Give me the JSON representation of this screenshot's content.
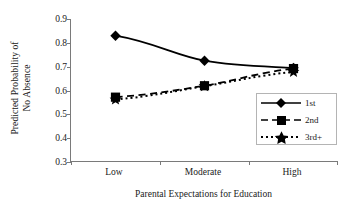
{
  "chart_data": {
    "type": "line",
    "title": "",
    "xlabel": "Parental Expectations for Education",
    "ylabel_line1": "Predicted Probability of",
    "ylabel_line2": "No Absence",
    "categories": [
      "Low",
      "Moderate",
      "High"
    ],
    "ylim": [
      0.3,
      0.9
    ],
    "yticks": [
      0.3,
      0.4,
      0.5,
      0.6,
      0.7,
      0.8,
      0.9
    ],
    "ytick_labels": [
      "0.3",
      "0.4",
      "0.5",
      "0.6",
      "0.7",
      "0.8",
      "0.9"
    ],
    "grid": false,
    "legend_position": "lower-right-inside",
    "series": [
      {
        "name": "1st",
        "values": [
          0.83,
          0.725,
          0.695
        ],
        "marker": "diamond",
        "linestyle": "solid",
        "color": "#000000"
      },
      {
        "name": "2nd",
        "values": [
          0.572,
          0.62,
          0.692
        ],
        "marker": "square",
        "linestyle": "dashed",
        "color": "#000000"
      },
      {
        "name": "3rd+",
        "values": [
          0.562,
          0.618,
          0.678
        ],
        "marker": "star",
        "linestyle": "dotted",
        "color": "#000000"
      }
    ]
  },
  "legend": {
    "entries": [
      {
        "label": "1st"
      },
      {
        "label": "2nd"
      },
      {
        "label": "3rd+"
      }
    ]
  },
  "axes": {
    "colors": {
      "axis_line": "#7a7a7a",
      "legend_border": "#b4b4b4",
      "ink": "#000000",
      "background": "#ffffff"
    }
  }
}
